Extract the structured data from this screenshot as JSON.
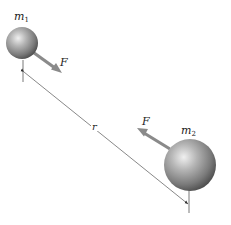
{
  "diagram": {
    "mass1": {
      "label": "m",
      "subscript": "1"
    },
    "mass2": {
      "label": "m",
      "subscript": "2"
    },
    "force1": {
      "label": "F"
    },
    "force2": {
      "label": "F"
    },
    "distance": {
      "label": "r"
    }
  },
  "colors": {
    "sphere_light": "#e6e6e6",
    "sphere_mid": "#9a9a9a",
    "sphere_dark": "#4a4a4a",
    "arrow": "#8a8a8a",
    "line": "#555555",
    "text": "#222222"
  }
}
